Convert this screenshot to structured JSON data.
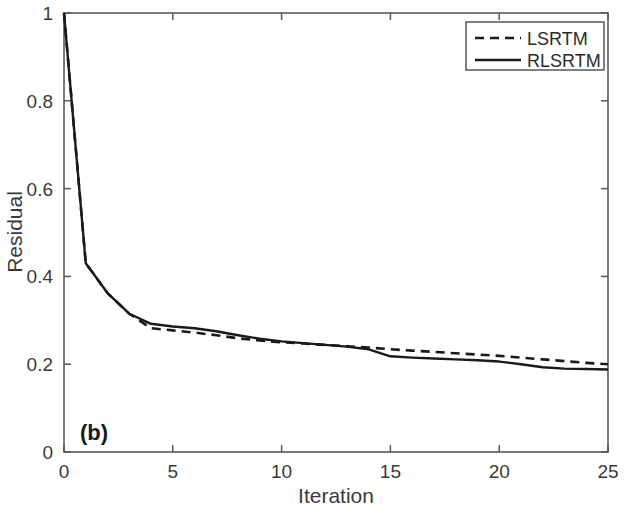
{
  "chart_data": {
    "type": "line",
    "title": "",
    "panel_label": "(b)",
    "xlabel": "Iteration",
    "ylabel": "Residual",
    "xlim": [
      0,
      25
    ],
    "ylim": [
      0,
      1
    ],
    "xticks": [
      0,
      5,
      10,
      15,
      20,
      25
    ],
    "xticklabels": [
      "0",
      "5",
      "10",
      "15",
      "20",
      "25"
    ],
    "yticks": [
      0,
      0.2,
      0.4,
      0.6,
      0.8,
      1
    ],
    "yticklabels": [
      "0",
      "0.2",
      "0.4",
      "0.6",
      "0.8",
      "1"
    ],
    "grid": false,
    "legend_position": "top-right",
    "x": [
      0,
      1,
      2,
      3,
      4,
      5,
      6,
      7,
      8,
      9,
      10,
      11,
      12,
      13,
      14,
      15,
      16,
      17,
      18,
      19,
      20,
      21,
      22,
      23,
      24,
      25
    ],
    "series": [
      {
        "name": "LSRTM",
        "style": "dashed",
        "color": "#1a1a1a",
        "values": [
          1.0,
          0.43,
          0.362,
          0.315,
          0.282,
          0.277,
          0.272,
          0.266,
          0.259,
          0.254,
          0.25,
          0.247,
          0.244,
          0.241,
          0.238,
          0.234,
          0.231,
          0.228,
          0.225,
          0.222,
          0.219,
          0.215,
          0.211,
          0.207,
          0.203,
          0.2
        ]
      },
      {
        "name": "RLSRTM",
        "style": "solid",
        "color": "#1a1a1a",
        "values": [
          1.0,
          0.43,
          0.362,
          0.315,
          0.292,
          0.286,
          0.282,
          0.275,
          0.266,
          0.258,
          0.252,
          0.248,
          0.244,
          0.24,
          0.234,
          0.218,
          0.215,
          0.213,
          0.211,
          0.209,
          0.206,
          0.2,
          0.193,
          0.19,
          0.189,
          0.188
        ]
      }
    ]
  },
  "legend": {
    "entries": [
      {
        "label": "LSRTM",
        "style": "dashed"
      },
      {
        "label": "RLSRTM",
        "style": "solid"
      }
    ]
  },
  "axes": {
    "x_title": "Iteration",
    "y_title": "Residual"
  },
  "panel": {
    "label": "(b)"
  },
  "colors": {
    "line": "#1a1a1a",
    "axis": "#5a5a5a",
    "text": "#3a3a3a",
    "background": "#ffffff"
  }
}
